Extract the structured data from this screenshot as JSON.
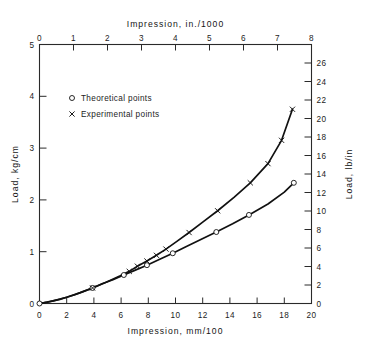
{
  "chart_data": {
    "type": "line",
    "title": "",
    "xlabel": "Impression,    mm/100",
    "ylabel": "Load,   kg/cm",
    "x2label": "Impression,    in./1000",
    "y2label": "Load,   lb/in",
    "xlim": [
      0,
      20
    ],
    "ylim": [
      0,
      5
    ],
    "x2lim": [
      0,
      8
    ],
    "y2lim": [
      0,
      28
    ],
    "xticks": [
      0,
      2,
      4,
      6,
      8,
      10,
      12,
      14,
      16,
      18,
      20
    ],
    "xticklabels": [
      "0",
      "2",
      "4",
      "6",
      "8",
      "10",
      "12",
      "14",
      "16",
      "18",
      "20"
    ],
    "yticks": [
      0,
      1,
      2,
      3,
      4,
      5
    ],
    "yticklabels": [
      "0",
      "1",
      "2",
      "3",
      "4",
      "5"
    ],
    "x2ticks": [
      0,
      1,
      2,
      3,
      4,
      5,
      6,
      7,
      8
    ],
    "x2ticklabels": [
      "0",
      "1",
      "2",
      "3",
      "4",
      "5",
      "6",
      "7",
      "8"
    ],
    "y2ticks": [
      0,
      2,
      4,
      6,
      8,
      10,
      12,
      14,
      16,
      18,
      20,
      22,
      24,
      26
    ],
    "y2ticklabels": [
      "0",
      "2",
      "4",
      "6",
      "8",
      "10",
      "12",
      "14",
      "16",
      "18",
      "20",
      "22",
      "24",
      "26"
    ],
    "grid": false,
    "legend_position": "upper-left-inside",
    "series": [
      {
        "name": "Theoretical points",
        "marker": "circle",
        "marker_glyph": "o",
        "x": [
          0.0,
          0.5,
          1.0,
          1.5,
          2.0,
          2.6,
          3.2,
          3.9,
          4.6,
          5.4,
          6.2,
          7.0,
          7.9,
          8.8,
          9.8,
          10.8,
          11.9,
          13.0,
          14.2,
          15.4,
          16.8,
          18.0,
          18.7
        ],
        "y": [
          0.0,
          0.02,
          0.05,
          0.08,
          0.12,
          0.17,
          0.23,
          0.3,
          0.38,
          0.46,
          0.55,
          0.64,
          0.74,
          0.85,
          0.97,
          1.1,
          1.24,
          1.38,
          1.54,
          1.71,
          1.92,
          2.15,
          2.33
        ],
        "marker_x": [
          0.0,
          3.9,
          6.2,
          7.9,
          9.8,
          13.0,
          15.4,
          18.7
        ],
        "marker_y": [
          0.0,
          0.3,
          0.55,
          0.74,
          0.97,
          1.38,
          1.71,
          2.33
        ]
      },
      {
        "name": "Experimental points",
        "marker": "cross",
        "marker_glyph": "x",
        "x": [
          0.0,
          1.0,
          2.0,
          3.0,
          3.9,
          4.9,
          5.9,
          6.6,
          7.2,
          7.9,
          8.6,
          9.3,
          10.1,
          11.0,
          12.0,
          13.1,
          14.3,
          15.5,
          16.8,
          17.8,
          18.6
        ],
        "y": [
          0.0,
          0.05,
          0.12,
          0.21,
          0.3,
          0.41,
          0.53,
          0.62,
          0.72,
          0.82,
          0.93,
          1.05,
          1.2,
          1.37,
          1.57,
          1.79,
          2.05,
          2.33,
          2.7,
          3.15,
          3.75
        ],
        "marker_x": [
          3.9,
          6.6,
          7.2,
          7.9,
          8.6,
          9.3,
          11.0,
          13.1,
          15.5,
          16.8,
          17.8,
          18.6
        ],
        "marker_y": [
          0.3,
          0.62,
          0.72,
          0.82,
          0.93,
          1.05,
          1.37,
          1.79,
          2.33,
          2.7,
          3.15,
          3.75
        ]
      }
    ]
  },
  "legend": {
    "items": [
      {
        "glyph": "o",
        "label": "Theoretical points"
      },
      {
        "glyph": "x",
        "label": "Experimental points"
      }
    ]
  },
  "colors": {
    "line": "#111111",
    "axis": "#2a2a2a",
    "background": "#ffffff"
  }
}
